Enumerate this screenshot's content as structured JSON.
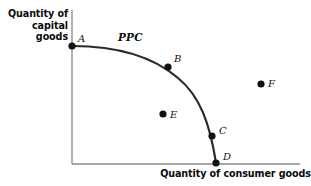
{
  "figure": {
    "background_color": "#ffffff",
    "width": 311,
    "height": 186
  },
  "axes": {
    "color": "#8a8a8a",
    "y_title": "Quantity of capital goods",
    "x_title": "Quantity of consumer goods",
    "origin": {
      "x": 72,
      "y": 164
    },
    "y_top": 10,
    "x_right": 300
  },
  "curve": {
    "label": "PPC",
    "label_position": {
      "x": 118,
      "y": 31
    },
    "color": "#2b2b2b",
    "width": 2.2,
    "path": "M 72,46 C 110,46 150,54 178,78 C 200,96 210,124 216,163"
  },
  "chart_data": {
    "type": "scatter",
    "title": "",
    "xlabel": "Quantity of consumer goods",
    "ylabel": "Quantity of capital goods",
    "curve_name": "PPC",
    "grid": false,
    "legend": "none",
    "points": [
      {
        "label": "A",
        "x": 72,
        "y": 46,
        "on_curve": true,
        "label_dx": 6,
        "label_dy": -12
      },
      {
        "label": "B",
        "x": 168,
        "y": 67,
        "on_curve": true,
        "label_dx": 6,
        "label_dy": -13
      },
      {
        "label": "C",
        "x": 212,
        "y": 136,
        "on_curve": true,
        "label_dx": 7,
        "label_dy": -10
      },
      {
        "label": "D",
        "x": 216,
        "y": 163,
        "on_curve": true,
        "label_dx": 7,
        "label_dy": -11
      },
      {
        "label": "E",
        "x": 163,
        "y": 114,
        "on_curve": false,
        "label_dx": 7,
        "label_dy": -4
      },
      {
        "label": "F",
        "x": 261,
        "y": 84,
        "on_curve": false,
        "label_dx": 7,
        "label_dy": -5
      }
    ],
    "point_color": "#111111",
    "point_radius": 3.6
  }
}
